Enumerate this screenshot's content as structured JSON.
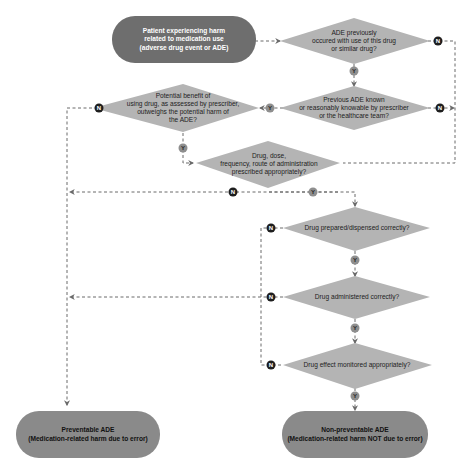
{
  "diagram": {
    "type": "flowchart",
    "colors": {
      "terminal_start": "#6e6e6e",
      "terminal_end": "#8a8a8a",
      "decision": "#b4b4b4",
      "connector": "#6a6a6a",
      "badge_n": "#1e1e1e",
      "badge_y": "#8e8e8e"
    },
    "nodes": {
      "start": "Patient experiencing harm\nrelated to medication use\n(adverse drug event or ADE)",
      "d1": "ADE previously\noccured with use of this drug\nor similar drug?",
      "d2": "Previous ADE known\nor reasonably knowable by prescriber\nor the healthcare team?",
      "d3": "Potential benefit of\nusing drug, as assessed by prescriber,\noutweighs the potential harm of\nthe ADE?",
      "d4": "Drug, dose,\nfrequency, route of administration\nprescribed appropriately?",
      "d5": "Drug prepared/dispensed correctly?",
      "d6": "Drug administered correctly?",
      "d7": "Drug effect monitored appropriately?",
      "end_preventable": "Preventable ADE\n(Medication-related harm due to error)",
      "end_nonpreventable": "Non-preventable ADE\n(Medication-related harm NOT due to error)"
    },
    "badges": {
      "yes": "Y",
      "no": "N"
    },
    "edges": [
      {
        "from": "start",
        "to": "d1",
        "label": ""
      },
      {
        "from": "d1",
        "to": "d2",
        "label": "Y"
      },
      {
        "from": "d1",
        "to": "d4",
        "label": "N"
      },
      {
        "from": "d2",
        "to": "d3",
        "label": "Y"
      },
      {
        "from": "d2",
        "to": "d4",
        "label": "N"
      },
      {
        "from": "d3",
        "to": "d4",
        "label": "Y"
      },
      {
        "from": "d3",
        "to": "end_preventable",
        "label": "N"
      },
      {
        "from": "d4",
        "to": "d5",
        "label": "Y"
      },
      {
        "from": "d4",
        "to": "end_preventable",
        "label": "N"
      },
      {
        "from": "d5",
        "to": "d6",
        "label": "Y"
      },
      {
        "from": "d5",
        "to": "end_preventable",
        "label": "N"
      },
      {
        "from": "d6",
        "to": "d7",
        "label": "Y"
      },
      {
        "from": "d6",
        "to": "end_preventable",
        "label": "N"
      },
      {
        "from": "d7",
        "to": "end_nonpreventable",
        "label": "Y"
      },
      {
        "from": "d7",
        "to": "end_preventable",
        "label": "N"
      }
    ]
  }
}
